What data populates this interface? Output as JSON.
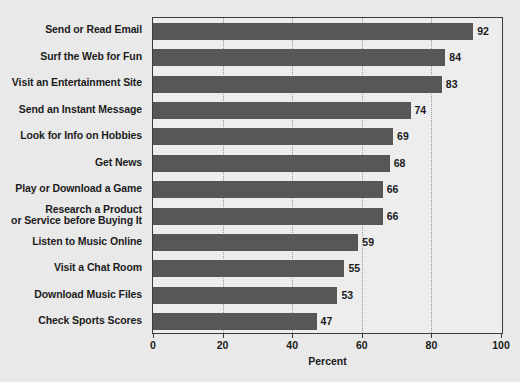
{
  "chart_data": {
    "type": "bar",
    "orientation": "horizontal",
    "title": "",
    "xlabel": "Percent",
    "ylabel": "",
    "xlim": [
      0,
      100
    ],
    "xticks": [
      0,
      20,
      40,
      60,
      80,
      100
    ],
    "grid": "vertical-dotted",
    "legend": "none",
    "bar_color": "#575757",
    "plot_background": "#ededed",
    "page_background": "#e9e9e9",
    "frame_color": "#3b3b3b",
    "categories": [
      "Send or Read Email",
      "Surf the Web for Fun",
      "Visit an Entertainment Site",
      "Send an Instant Message",
      "Look for Info on Hobbies",
      "Get News",
      "Play or Download a Game",
      "Research a Product or Service before Buying It",
      "Listen to Music Online",
      "Visit a Chat Room",
      "Download Music Files",
      "Check Sports Scores"
    ],
    "category_lines": [
      [
        "Send or Read Email"
      ],
      [
        "Surf the Web for Fun"
      ],
      [
        "Visit an Entertainment Site"
      ],
      [
        "Send an Instant Message"
      ],
      [
        "Look for Info on Hobbies"
      ],
      [
        "Get News"
      ],
      [
        "Play or Download a Game"
      ],
      [
        "Research a Product",
        "or Service before Buying It"
      ],
      [
        "Listen to Music Online"
      ],
      [
        "Visit a Chat Room"
      ],
      [
        "Download Music Files"
      ],
      [
        "Check Sports Scores"
      ]
    ],
    "values": [
      92,
      84,
      83,
      74,
      69,
      68,
      66,
      66,
      59,
      55,
      53,
      47
    ]
  }
}
